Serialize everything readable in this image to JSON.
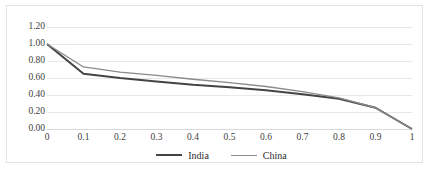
{
  "chart_data": {
    "type": "line",
    "title": "",
    "subtitle": "",
    "xlabel": "",
    "ylabel": "",
    "x": [
      0,
      0.1,
      0.2,
      0.3,
      0.4,
      0.5,
      0.6,
      0.7,
      0.8,
      0.9,
      1
    ],
    "xtick_labels": [
      "0",
      "0.1",
      "0.2",
      "0.3",
      "0.4",
      "0.5",
      "0.6",
      "0.7",
      "0.8",
      "0.9",
      "1"
    ],
    "ytick_labels": [
      "0.00",
      "0.20",
      "0.40",
      "0.60",
      "0.80",
      "1.00",
      "1.20"
    ],
    "ytick_values": [
      0.0,
      0.2,
      0.4,
      0.6,
      0.8,
      1.0,
      1.2
    ],
    "xlim": [
      0,
      1
    ],
    "ylim": [
      0,
      1.2
    ],
    "grid": "horizontal",
    "legend_position": "bottom-center",
    "series": [
      {
        "name": "India",
        "color": "#444444",
        "width": 2.0,
        "values": [
          1.0,
          0.65,
          0.6,
          0.56,
          0.52,
          0.49,
          0.455,
          0.41,
          0.355,
          0.25,
          0.0
        ]
      },
      {
        "name": "China",
        "color": "#8a8a8a",
        "width": 1.3,
        "values": [
          1.0,
          0.73,
          0.67,
          0.63,
          0.585,
          0.545,
          0.5,
          0.44,
          0.365,
          0.25,
          0.0
        ]
      }
    ]
  },
  "colors": {
    "frame": "#e3e3e3",
    "gridline": "#e8e8e8",
    "axis": "#d9d9d9",
    "tick_text": "#3d3d3d",
    "legend_text": "#2b2b2b",
    "background": "#ffffff"
  }
}
